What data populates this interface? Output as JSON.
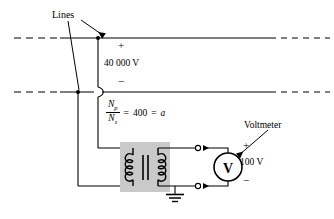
{
  "figure": {
    "type": "circuit-diagram",
    "width": 334,
    "height": 219
  },
  "labels": {
    "lines": "Lines",
    "hv_plus": "+",
    "hv_value": "40 000 V",
    "hv_minus": "−",
    "voltmeter": "Voltmeter",
    "vm_plus": "+",
    "vm_value": "100 V",
    "vm_minus": "−",
    "voltmeter_symbol": "V"
  },
  "turns_ratio": {
    "numerator": "N",
    "numerator_sub": "p",
    "denominator": "N",
    "denominator_sub": "s",
    "equals_1": "=",
    "value": "400",
    "equals_2": "=",
    "variable": "a"
  },
  "components": [
    {
      "name": "transmission-line-top",
      "style": "dashed-solid-dashed",
      "y": 38
    },
    {
      "name": "transmission-line-bottom",
      "style": "dashed-solid-dashed",
      "y": 92
    },
    {
      "name": "junction-dot-top",
      "x": 98,
      "y": 38
    },
    {
      "name": "junction-dot-bottom",
      "x": 78,
      "y": 92
    },
    {
      "name": "wire-hop",
      "x": 98,
      "y": 92
    },
    {
      "name": "transformer",
      "x": 120,
      "y": 142,
      "shaded": true
    },
    {
      "name": "primary-coil",
      "turns": 4
    },
    {
      "name": "secondary-coil",
      "turns": 4
    },
    {
      "name": "core-bars",
      "count": 2
    },
    {
      "name": "ground-symbol",
      "x": 175,
      "y": 190
    },
    {
      "name": "terminal-top",
      "x": 198,
      "y": 148
    },
    {
      "name": "terminal-bottom",
      "x": 198,
      "y": 186
    },
    {
      "name": "voltmeter-circle",
      "cx": 228,
      "cy": 167,
      "r": 14
    }
  ],
  "colors": {
    "ink": "#000000",
    "background": "#ffffff",
    "transformer_shade": "#c9c9c9"
  }
}
